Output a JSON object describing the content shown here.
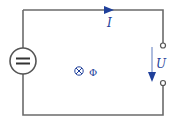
{
  "diagram": {
    "type": "circuit",
    "source": {
      "symbol": "=",
      "kind": "dc-voltage-source"
    },
    "current": {
      "label": "I",
      "direction": "right"
    },
    "voltage": {
      "label": "U",
      "direction": "down"
    },
    "flux": {
      "symbol": "⊗",
      "label": "Φ",
      "direction": "into-page"
    },
    "colors": {
      "wire": "#6b6b6b",
      "accent": "#1f3f9a"
    }
  }
}
